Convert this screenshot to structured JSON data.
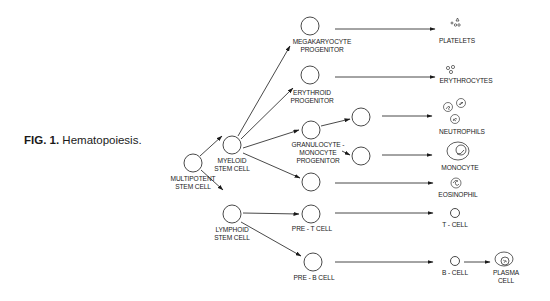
{
  "caption": {
    "figure": "FIG. 1.",
    "title": "Hematopoiesis."
  },
  "nodes": {
    "multipotent": "MULTIPOTENT\nSTEM CELL",
    "myeloid": "MYELOID\nSTEM CELL",
    "lymphoid": "LYMPHOID\nSTEM CELL",
    "megakaryocyte": "MEGAKARYOCYTE\nPROGENITOR",
    "erythroid": "ERYTHROID\nPROGENITOR",
    "granulocyte_monocyte": "GRANULOCYTE -\nMONOCYTE\nPROGENITOR",
    "pre_t": "PRE - T CELL",
    "pre_b": "PRE - B CELL"
  },
  "end_cells": {
    "platelets": "PLATELETS",
    "erythrocytes": "ERYTHROCYTES",
    "neutrophils": "NEUTROPHILS",
    "monocyte": "MONOCYTE",
    "eosinophil": "EOSINOPHIL",
    "t_cell": "T - CELL",
    "b_cell": "B - CELL",
    "plasma_cell": "PLASMA\nCELL"
  },
  "colors": {
    "ink": "#1a1a1a",
    "background": "#ffffff"
  }
}
